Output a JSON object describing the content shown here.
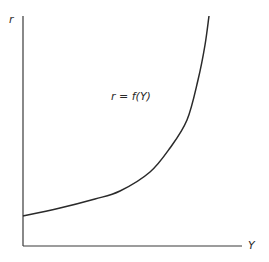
{
  "chart_data": {
    "type": "line",
    "title": "",
    "xlabel": "Y",
    "ylabel": "r",
    "grid": false,
    "legend": null,
    "annotations": [
      {
        "text": "r = f(Y)",
        "position": "middle, left of curve"
      }
    ],
    "ticks": {
      "x": [],
      "y": []
    },
    "series": [
      {
        "name": "r = f(Y)",
        "description": "convex, increasing curve; starts above zero at Y=0 and rises steeply (approaching vertical) at high Y",
        "points_px": [
          [
            23,
            216
          ],
          [
            60,
            208
          ],
          [
            95,
            199
          ],
          [
            120,
            191
          ],
          [
            150,
            172
          ],
          [
            170,
            148
          ],
          [
            187,
            120
          ],
          [
            198,
            80
          ],
          [
            205,
            45
          ],
          [
            209,
            16
          ]
        ]
      }
    ],
    "axis_color": "#333333",
    "curve_color": "#2a2a2a"
  },
  "labels": {
    "y_axis": "r",
    "x_axis": "Y",
    "curve": "r = f(Y)"
  }
}
